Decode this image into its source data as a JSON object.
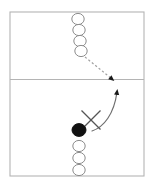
{
  "canvas": {
    "width": 154,
    "height": 187,
    "background": "#ffffff"
  },
  "court": {
    "name": "court-outline",
    "x": 10,
    "y": 12,
    "width": 134,
    "height": 164,
    "stroke_color": "#b4b4b4",
    "stroke_width": 1.1,
    "fill": "#ffffff"
  },
  "net_line": {
    "name": "net-center-line",
    "x1": 10,
    "y1": 79.5,
    "x2": 144,
    "y2": 79.5,
    "stroke_color": "#b4b4b4",
    "stroke_width": 1.1
  },
  "players": {
    "open_circle_style": {
      "fill": "#ffffff",
      "stroke_color": "#8c8c8c",
      "stroke_width": 1.0,
      "radius_x": 6.2,
      "radius_y": 5.6
    },
    "filled_circle_style": {
      "fill": "#111111",
      "stroke_color": "#111111",
      "stroke_width": 1.0,
      "radius_x": 7.0,
      "radius_y": 6.4
    },
    "top_queue": [
      {
        "label": "top-queue-player-1",
        "cx": 78,
        "cy": 19
      },
      {
        "label": "top-queue-player-2",
        "cx": 79,
        "cy": 30
      },
      {
        "label": "top-queue-player-3",
        "cx": 80,
        "cy": 41
      },
      {
        "label": "top-queue-player-4",
        "cx": 81,
        "cy": 51
      }
    ],
    "active_player": {
      "label": "active-player-filled",
      "cx": 79,
      "cy": 130
    },
    "bottom_queue": [
      {
        "label": "bottom-queue-player-1",
        "cx": 79,
        "cy": 146
      },
      {
        "label": "bottom-queue-player-2",
        "cx": 79,
        "cy": 158
      },
      {
        "label": "bottom-queue-player-3",
        "cx": 79,
        "cy": 170
      }
    ]
  },
  "marks": {
    "x_mark": {
      "name": "x-target-mark",
      "center_x": 91,
      "center_y": 120,
      "arm": 9.5,
      "stroke_color": "#555555",
      "stroke_width": 1.3
    }
  },
  "arrows": {
    "dashed_pass": {
      "name": "dashed-pass-arrow",
      "style": "dashed",
      "dash_pattern": "2.2 2.2",
      "stroke_color": "#a0a0a0",
      "stroke_width": 1.2,
      "path": "M 85 57 L 112 79",
      "arrowhead_x": 113,
      "arrowhead_y": 80,
      "arrowhead_color": "#1a1a1a",
      "arrowhead_rotation": 40
    },
    "curved_attack": {
      "name": "curved-attack-arrow",
      "style": "solid",
      "stroke_color": "#6e6e6e",
      "stroke_width": 1.2,
      "path": "M 92 131 C 104 127, 114 114, 117 92",
      "arrowhead_x": 117,
      "arrowhead_y": 89,
      "arrowhead_color": "#1a1a1a",
      "arrowhead_rotation": -8
    }
  },
  "legend": {
    "open_circle_meaning": "waiting player",
    "filled_circle_meaning": "active player",
    "x_meaning": "target position",
    "dashed_arrow_meaning": "pass",
    "solid_arrow_meaning": "movement"
  }
}
